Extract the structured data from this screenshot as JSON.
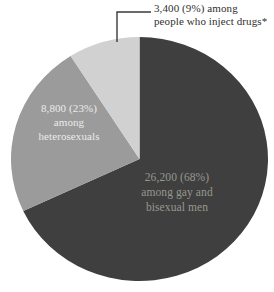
{
  "chart_data": {
    "type": "pie",
    "title": "",
    "legend_position": "none",
    "total": 38400,
    "start_angle_deg": 0,
    "direction": "clockwise",
    "slices": [
      {
        "id": "gay-bisexual-men",
        "label": "among gay and bisexual men",
        "value": 26200,
        "pct": 68,
        "display_value": "26,200 (68%)",
        "color": "#3f3f3f",
        "label_color": "#979790"
      },
      {
        "id": "heterosexuals",
        "label": "among heterosexuals",
        "value": 8800,
        "pct": 23,
        "display_value": "8,800 (23%)",
        "color": "#9b9b9b",
        "label_color": "#ebebeb"
      },
      {
        "id": "inject-drugs",
        "label": "among people who inject drugs*",
        "value": 3400,
        "pct": 9,
        "display_value": "3,400 (9%)",
        "color": "#d1d1d1",
        "label_color": "#2f2f2f"
      }
    ],
    "labels": {
      "injectors": {
        "lines": [
          "3,400 (9%) among",
          "people who inject drugs*"
        ]
      },
      "heterosexuals": {
        "lines": [
          "8,800 (23%)",
          "among",
          "heterosexuals"
        ]
      },
      "msm": {
        "lines": [
          "26,200 (68%)",
          "among gay and",
          "bisexual men"
        ]
      }
    },
    "callout": {
      "color": "#3a3a3a"
    },
    "background_color": "#ffffff"
  }
}
